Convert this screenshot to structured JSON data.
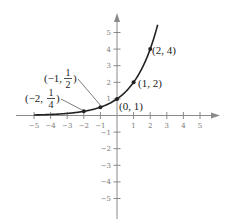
{
  "chart_data": {
    "type": "line",
    "title": "",
    "function": "y = 2^x",
    "xlabel": "",
    "ylabel": "",
    "xlim": [
      -5,
      5
    ],
    "ylim": [
      -5,
      5
    ],
    "grid": false,
    "x_ticks": [
      -5,
      -4,
      -3,
      -2,
      -1,
      1,
      2,
      3,
      4,
      5
    ],
    "y_ticks": [
      -5,
      -4,
      -3,
      -2,
      -1,
      1,
      2,
      3,
      4,
      5
    ],
    "x_tick_labels": [
      "−5",
      "−4",
      "−3",
      "−2",
      "−1",
      "1",
      "2",
      "3",
      "4",
      "5"
    ],
    "y_tick_labels": [
      "−5",
      "−4",
      "−3",
      "−2",
      "−1",
      "1",
      "2",
      "3",
      "4",
      "5"
    ],
    "series": [
      {
        "name": "y = 2^x",
        "points": [
          {
            "x": -2,
            "y": 0.25,
            "label": "(−2, 1/4)"
          },
          {
            "x": -1,
            "y": 0.5,
            "label": "(−1, 1/2)"
          },
          {
            "x": 0,
            "y": 1,
            "label": "(0, 1)"
          },
          {
            "x": 1,
            "y": 2,
            "label": "(1, 2)"
          },
          {
            "x": 2,
            "y": 4,
            "label": "(2, 4)"
          }
        ]
      }
    ],
    "annotations": {
      "p_m2": {
        "pre": "(−2, ",
        "num": "1",
        "den": "4",
        "post": ")"
      },
      "p_m1": {
        "pre": "(−1, ",
        "num": "1",
        "den": "2",
        "post": ")"
      },
      "p_0": "(0, 1)",
      "p_1": "(1, 2)",
      "p_2": "(2, 4)"
    }
  }
}
